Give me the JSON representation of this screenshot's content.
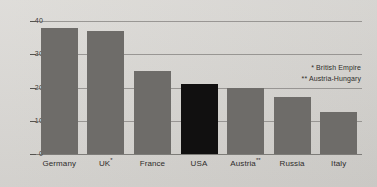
{
  "chart_data": {
    "type": "bar",
    "title": "",
    "subtitle": "",
    "xlabel": "",
    "ylabel": "",
    "ylim": [
      0,
      40
    ],
    "grid": true,
    "legend_position": "none",
    "categories": [
      "Germany",
      "UK*",
      "France",
      "USA",
      "Austria**",
      "Russia",
      "Italy"
    ],
    "values": [
      38,
      37,
      25,
      21,
      20,
      17,
      12.5
    ],
    "y_ticks": [
      "0",
      "10",
      "20",
      "30",
      "40"
    ],
    "y_tick_values": [
      0,
      10,
      20,
      30,
      40
    ],
    "highlight_category": "USA",
    "series": [
      {
        "name": "",
        "values": [
          38,
          37,
          25,
          21,
          20,
          17,
          12.5
        ]
      }
    ],
    "annotations": [
      "* British Empire",
      "** Austria-Hungary"
    ],
    "colors": {
      "bar": "#6e6c69",
      "bar_highlight": "#111010",
      "background": "#d9d7d3",
      "gridline": "#8d8b88",
      "text": "#2e2c2a"
    }
  },
  "footnotes": [
    {
      "marker": "*",
      "text": "British Empire",
      "full": "* British Empire"
    },
    {
      "marker": "**",
      "text": "Austria-Hungary",
      "full": "** Austria-Hungary"
    }
  ],
  "axis": {
    "y_labels": [
      "40",
      "30",
      "20",
      "10",
      "0"
    ]
  },
  "bars": [
    {
      "label": "Germany",
      "label_base": "Germany",
      "marker": "",
      "value": 38
    },
    {
      "label": "UK*",
      "label_base": "UK",
      "marker": "*",
      "value": 37
    },
    {
      "label": "France",
      "label_base": "France",
      "marker": "",
      "value": 25
    },
    {
      "label": "USA",
      "label_base": "USA",
      "marker": "",
      "value": 21
    },
    {
      "label": "Austria**",
      "label_base": "Austria",
      "marker": "**",
      "value": 20
    },
    {
      "label": "Russia",
      "label_base": "Russia",
      "marker": "",
      "value": 17
    },
    {
      "label": "Italy",
      "label_base": "Italy",
      "marker": "",
      "value": 12.5
    }
  ]
}
